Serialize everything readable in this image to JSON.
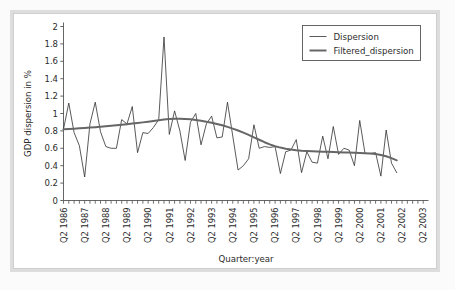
{
  "figure": {
    "border_color": "#dddddd",
    "background": "#ffffff"
  },
  "legend": {
    "position": "top-right",
    "entries": [
      {
        "label": "Dispersion",
        "color": "#303030",
        "width": 0.8
      },
      {
        "label": "Filtered_dispersion",
        "color": "#666666",
        "width": 2.0
      }
    ]
  },
  "axes": {
    "ylabel": "GDP dispersion in %",
    "xlabel": "Quarter:year",
    "yticks": [
      "0",
      "0.2",
      "0.4",
      "0.6",
      "0.8",
      "1",
      "1.2",
      "1.4",
      "1.6",
      "1.8",
      "2"
    ],
    "xticks": [
      "Q2 1986",
      "Q2 1987",
      "Q2 1988",
      "Q2 1989",
      "Q2 1990",
      "Q2 1991",
      "Q2 1992",
      "Q2 1993",
      "Q2 1994",
      "Q2 1995",
      "Q2 1996",
      "Q2 1997",
      "Q2 1998",
      "Q2 1999",
      "Q2 2000",
      "Q2 2001",
      "Q2 2002",
      "Q2 2003"
    ]
  },
  "chart_data": {
    "type": "line",
    "title": "",
    "xlabel": "Quarter:year",
    "ylabel": "GDP dispersion in %",
    "ylim": [
      0,
      2
    ],
    "yticks": [
      0,
      0.2,
      0.4,
      0.6,
      0.8,
      1,
      1.2,
      1.4,
      1.6,
      1.8,
      2
    ],
    "grid": false,
    "legend_position": "top-right",
    "x_major_labels": [
      "Q2 1986",
      "Q2 1987",
      "Q2 1988",
      "Q2 1989",
      "Q2 1990",
      "Q2 1991",
      "Q2 1992",
      "Q2 1993",
      "Q2 1994",
      "Q2 1995",
      "Q2 1996",
      "Q2 1997",
      "Q2 1998",
      "Q2 1999",
      "Q2 2000",
      "Q2 2001",
      "Q2 2002",
      "Q2 2003"
    ],
    "x_major_index": [
      0,
      4,
      8,
      12,
      16,
      20,
      24,
      28,
      32,
      36,
      40,
      44,
      48,
      52,
      56,
      60,
      64,
      68
    ],
    "x_minor_tick_every": 1,
    "x_unit": "quarter",
    "x_start": "Q2 1986",
    "x_end": "Q2 2003",
    "n_points": 64,
    "series": [
      {
        "name": "Dispersion",
        "color": "#303030",
        "linewidth": 0.8,
        "values": [
          0.82,
          1.12,
          0.78,
          0.63,
          0.27,
          0.88,
          1.13,
          0.79,
          0.62,
          0.6,
          0.6,
          0.93,
          0.88,
          1.08,
          0.55,
          0.78,
          0.77,
          0.84,
          0.93,
          1.88,
          0.76,
          1.03,
          0.8,
          0.46,
          0.9,
          1.0,
          0.64,
          0.88,
          0.97,
          0.72,
          0.73,
          1.13,
          0.74,
          0.35,
          0.4,
          0.48,
          0.87,
          0.6,
          0.62,
          0.61,
          0.62,
          0.31,
          0.56,
          0.58,
          0.7,
          0.32,
          0.56,
          0.44,
          0.43,
          0.74,
          0.48,
          0.85,
          0.53,
          0.6,
          0.58,
          0.4,
          0.92,
          0.54,
          0.54,
          0.55,
          0.28,
          0.81,
          0.43,
          0.32
        ]
      },
      {
        "name": "Filtered_dispersion",
        "color": "#666666",
        "linewidth": 2.0,
        "values": [
          0.818,
          0.822,
          0.826,
          0.83,
          0.834,
          0.838,
          0.843,
          0.848,
          0.853,
          0.858,
          0.864,
          0.87,
          0.877,
          0.884,
          0.891,
          0.898,
          0.906,
          0.914,
          0.922,
          0.93,
          0.936,
          0.939,
          0.94,
          0.938,
          0.933,
          0.926,
          0.917,
          0.906,
          0.894,
          0.88,
          0.864,
          0.846,
          0.826,
          0.804,
          0.78,
          0.754,
          0.726,
          0.698,
          0.67,
          0.645,
          0.624,
          0.608,
          0.596,
          0.586,
          0.578,
          0.572,
          0.568,
          0.565,
          0.563,
          0.561,
          0.559,
          0.557,
          0.555,
          0.553,
          0.551,
          0.549,
          0.547,
          0.544,
          0.54,
          0.534,
          0.524,
          0.508,
          0.487,
          0.462
        ]
      }
    ]
  }
}
